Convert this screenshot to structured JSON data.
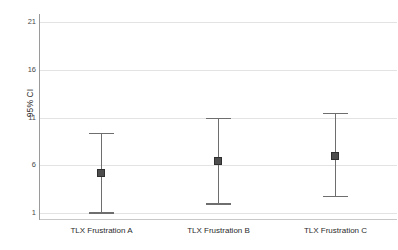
{
  "chart_data": {
    "type": "scatter",
    "title": "",
    "subtitle": "",
    "xlabel": "",
    "ylabel": "95% CI",
    "categories": [
      "TLX Frustration A",
      "TLX Frustration B",
      "TLX Frustration C"
    ],
    "ylim": [
      1,
      21
    ],
    "yticks": [
      1,
      6,
      11,
      16,
      21
    ],
    "ytick_labels": [
      "1",
      "6",
      "11",
      "16",
      "21"
    ],
    "grid": "horizontal",
    "legend": "none",
    "series": [
      {
        "name": "Mean with 95% CI",
        "values": [
          5.2,
          6.4,
          7.0
        ],
        "ci_lower": [
          1.1,
          2.0,
          2.8
        ],
        "ci_upper": [
          9.4,
          11.0,
          11.5
        ]
      }
    ],
    "points": [
      {
        "category": "TLX Frustration A",
        "mean": 5.2,
        "ci_lower": 1.1,
        "ci_upper": 9.4
      },
      {
        "category": "TLX Frustration B",
        "mean": 6.4,
        "ci_lower": 2.0,
        "ci_upper": 11.0
      },
      {
        "category": "TLX Frustration C",
        "mean": 7.0,
        "ci_lower": 2.8,
        "ci_upper": 11.5
      }
    ],
    "colors": {
      "background": "#ffffff",
      "gridline": "#e3e3e3",
      "axis": "#9a9a9a",
      "errorbar": "#6e6e6e",
      "marker": "#4d4d4d",
      "text": "#2b2b2b"
    }
  }
}
